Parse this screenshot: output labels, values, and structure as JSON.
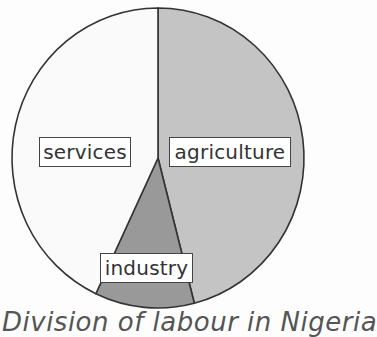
{
  "chart_data": {
    "type": "pie",
    "title": "Division of labour in Nigeria",
    "categories": [
      "agriculture",
      "industry",
      "services"
    ],
    "values": [
      46,
      11,
      43
    ],
    "unit": "%",
    "colors": {
      "agriculture": "#c4c4c4",
      "industry": "#999999",
      "services": "#fafafa"
    },
    "start_angle": "top, clockwise",
    "legend": "none (inline labels)"
  },
  "labels": {
    "agriculture": "agriculture",
    "industry": "industry",
    "services": "services"
  },
  "caption": "Division of labour in Nigeria"
}
